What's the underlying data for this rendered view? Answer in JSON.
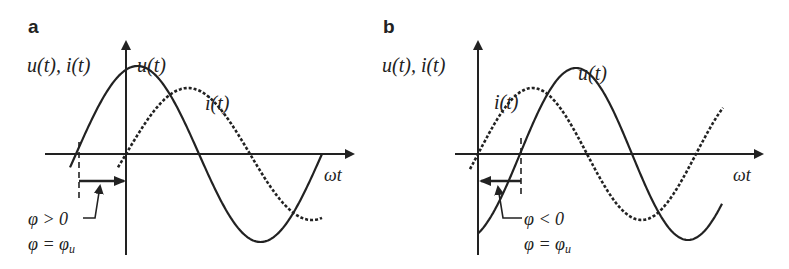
{
  "figure": {
    "panels": [
      {
        "id": "a",
        "letter": "a",
        "axis_label_y": "u(t), i(t)",
        "axis_label_x": "ωt",
        "curve_label_u": "u(t)",
        "curve_label_i": "i(t)",
        "phase_condition": "φ > 0",
        "phase_relation": "φ = φ",
        "phase_relation_sub": "u",
        "origin": [
          126,
          154
        ],
        "x_axis_range": [
          70,
          355
        ],
        "y_axis_range": [
          40,
          255
        ],
        "u": {
          "amplitude": 88,
          "half_period": 123,
          "zero_crossing": 76,
          "x_start": 70,
          "x_end": 322
        },
        "i": {
          "amplitude": 66,
          "half_period": 124,
          "zero_crossing": 126,
          "x_start": 118,
          "x_end": 322
        },
        "phase_arrow": {
          "from_x": 80,
          "to_x": 124,
          "y": 181,
          "direction": "right"
        }
      },
      {
        "id": "b",
        "letter": "b",
        "axis_label_y": "u(t), i(t)",
        "axis_label_x": "ωt",
        "curve_label_u": "u(t)",
        "curve_label_i": "i(t)",
        "phase_condition": "φ < 0",
        "phase_relation": "φ = φ",
        "phase_relation_sub": "u",
        "origin": [
          478,
          154
        ],
        "x_axis_range": [
          455,
          762
        ],
        "y_axis_range": [
          40,
          255
        ],
        "u": {
          "amplitude": 86,
          "half_period": 112,
          "zero_crossing": 520,
          "x_start": 478,
          "x_end": 722
        },
        "i": {
          "amplitude": 66,
          "half_period": 109,
          "zero_crossing": 478,
          "x_start": 470,
          "x_end": 723
        },
        "phase_arrow": {
          "from_x": 520,
          "to_x": 481,
          "y": 181,
          "direction": "left"
        }
      }
    ]
  }
}
